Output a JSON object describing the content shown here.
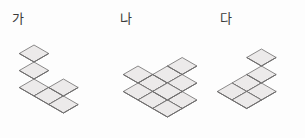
{
  "page": {
    "background_color": "#fdfdfd",
    "width": 305,
    "height": 138
  },
  "colors": {
    "cube_top": "#eceaea",
    "cube_left": "#d5d3d3",
    "cube_right": "#b4b2b2",
    "cube_stroke": "#6f6d6d",
    "label_text": "#3a3a3a",
    "paren_text": "#6a6a6a"
  },
  "figures": [
    {
      "label": "가",
      "label_x": 12,
      "label_y": 12,
      "origin_x": 34,
      "origin_y": 96,
      "cube_size": 17,
      "description": "U-shaped solid: three-cube tower at left, single-cube-high middle row, two-cube tower at right",
      "cube_count": 7,
      "cells": [
        {
          "col": 0,
          "row": 0,
          "level": 0
        },
        {
          "col": 0,
          "row": 0,
          "level": 1
        },
        {
          "col": 0,
          "row": 0,
          "level": 2
        },
        {
          "col": 1,
          "row": 0,
          "level": 0
        },
        {
          "col": 2,
          "row": 0,
          "level": 0
        },
        {
          "col": 2,
          "row": 0,
          "level": 1
        }
      ]
    },
    {
      "label": "나",
      "label_x": 120,
      "label_y": 12,
      "origin_x": 138,
      "origin_y": 100,
      "cube_size": 17,
      "description": "Staircase solid rising from front-left to back-right, three cubes tall at the right",
      "cube_count": 10,
      "cells": [
        {
          "col": 0,
          "row": 0,
          "level": 0
        },
        {
          "col": 0,
          "row": 0,
          "level": 1
        },
        {
          "col": 1,
          "row": 0,
          "level": 0
        },
        {
          "col": 2,
          "row": 0,
          "level": 0
        },
        {
          "col": 2,
          "row": 0,
          "level": 1
        },
        {
          "col": 0,
          "row": 1,
          "level": 0
        },
        {
          "col": 1,
          "row": 1,
          "level": 0
        },
        {
          "col": 1,
          "row": 1,
          "level": 1
        },
        {
          "col": 2,
          "row": 1,
          "level": 0
        },
        {
          "col": 2,
          "row": 1,
          "level": 1
        },
        {
          "col": 2,
          "row": 1,
          "level": 2
        }
      ]
    },
    {
      "label": "다",
      "label_x": 220,
      "label_y": 12,
      "origin_x": 232,
      "origin_y": 100,
      "cube_size": 17,
      "description": "L-shaped solid: flat two-by-two base with a two-cube tower rising at the back right",
      "cube_count": 6,
      "cells": [
        {
          "col": 0,
          "row": 0,
          "level": 0
        },
        {
          "col": 1,
          "row": 0,
          "level": 0
        },
        {
          "col": 0,
          "row": 1,
          "level": 0
        },
        {
          "col": 1,
          "row": 1,
          "level": 0
        },
        {
          "col": 1,
          "row": 1,
          "level": 1
        },
        {
          "col": 1,
          "row": 1,
          "level": 2
        }
      ]
    }
  ],
  "answer_blank": {
    "open_paren": "(",
    "close_paren": ")"
  }
}
